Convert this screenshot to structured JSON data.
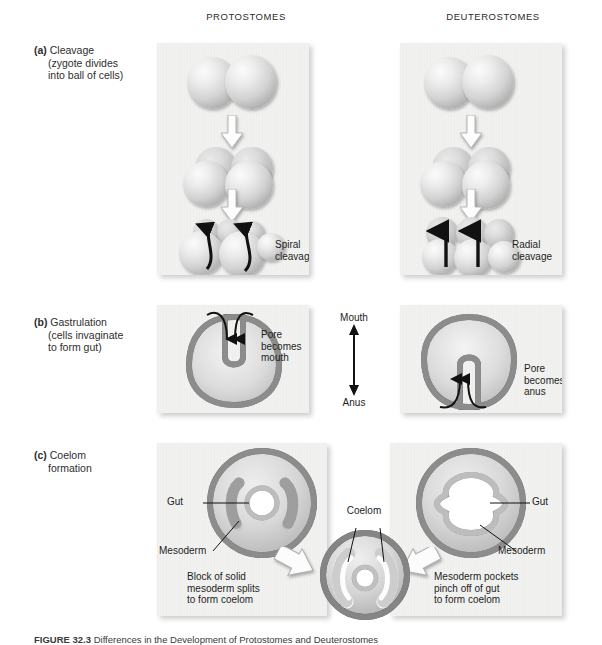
{
  "figure": {
    "caption_label": "FIGURE 32.3",
    "caption_text": "Differences in the Development of Protostomes and Deuterostomes"
  },
  "columns": {
    "protostomes": "PROTOSTOMES",
    "deuterostomes": "DEUTEROSTOMES"
  },
  "rows": {
    "a": {
      "marker": "(a)",
      "title": "Cleavage",
      "sub1": "(zygote divides",
      "sub2": "into ball of cells)"
    },
    "b": {
      "marker": "(b)",
      "title": "Gastrulation",
      "sub1": "(cells invaginate",
      "sub2": "to form gut)"
    },
    "c": {
      "marker": "(c)",
      "title": "Coelom",
      "sub1": "formation"
    }
  },
  "cleavage": {
    "protostome_label": "Spiral\ncleavage",
    "deuterostome_label": "Radial\ncleavage"
  },
  "gastrulation": {
    "protostome_label": "Pore\nbecomes\nmouth",
    "deuterostome_label": "Pore\nbecomes\nanus",
    "axis_top": "Mouth",
    "axis_bottom": "Anus"
  },
  "coelom": {
    "protostome_gut": "Gut",
    "protostome_mesoderm": "Mesoderm",
    "deuterostome_gut": "Gut",
    "deuterostome_mesoderm": "Mesoderm",
    "center_label": "Coelom",
    "protostome_text": "Block of solid\nmesoderm splits\nto form coelom",
    "deuterostome_text": "Mesoderm pockets\npinch off of gut\nto form coelom"
  },
  "colors": {
    "panel_bg": "#f1f1f0",
    "cell_layer": "#6e6e6e",
    "interior": "#cfcfcf",
    "text": "#1e1e1e"
  }
}
